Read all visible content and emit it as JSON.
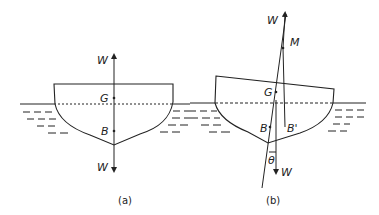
{
  "figure": {
    "panel_a": {
      "caption": "(a)",
      "labels": {
        "weight_top": "W",
        "center_gravity": "G",
        "center_buoyancy": "B",
        "weight_bottom": "W"
      }
    },
    "panel_b": {
      "caption": "(b)",
      "labels": {
        "weight_top": "W",
        "metacentre": "M",
        "center_gravity": "G",
        "center_buoyancy": "B",
        "new_center_buoyancy": "B'",
        "angle": "θ",
        "weight_bottom": "W"
      }
    }
  },
  "colors": {
    "line": "#222222",
    "background": "#ffffff"
  }
}
